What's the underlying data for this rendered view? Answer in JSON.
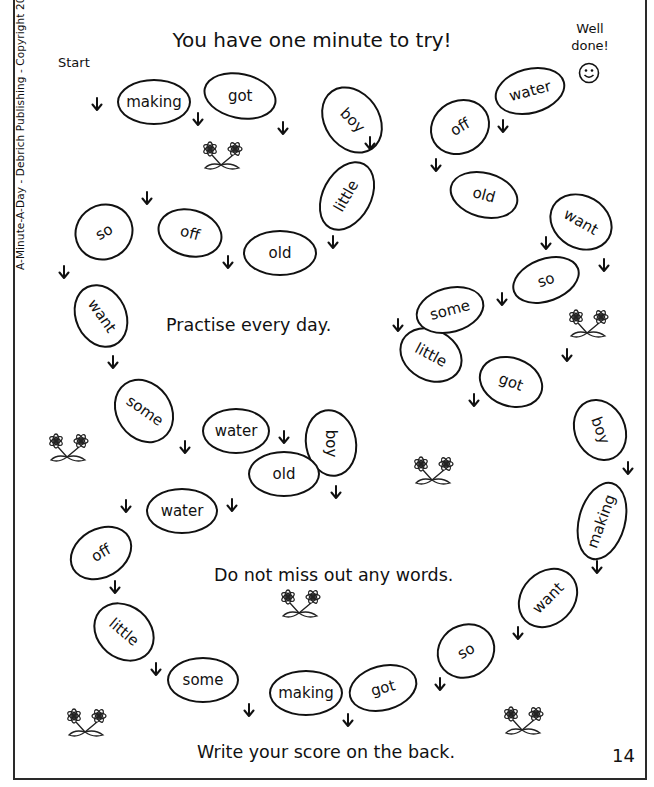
{
  "page": {
    "title": "You have one minute to try!",
    "start_label": "Start",
    "finish_label_line1": "Well",
    "finish_label_line2": "done!",
    "finish_icon": "smiley-face-icon",
    "side_credit": "A-Minute-A-Day - Debrich Publishing - Copyright 2019",
    "messages": [
      "Practise every day.",
      "Do not miss out any words.",
      "Write your score on the back."
    ],
    "page_number": "14"
  },
  "path": {
    "words": [
      {
        "word": "making",
        "x": 154,
        "y": 102,
        "w": 74,
        "h": 46,
        "oval_rot": 0,
        "text_rot": 0
      },
      {
        "word": "got",
        "x": 240,
        "y": 96,
        "w": 74,
        "h": 46,
        "oval_rot": 12,
        "text_rot": 0
      },
      {
        "word": "boy",
        "x": 352,
        "y": 120,
        "w": 56,
        "h": 72,
        "oval_rot": -35,
        "text_rot": 45
      },
      {
        "word": "little",
        "x": 347,
        "y": 196,
        "w": 50,
        "h": 74,
        "oval_rot": 28,
        "text_rot": -60
      },
      {
        "word": "old",
        "x": 280,
        "y": 253,
        "w": 74,
        "h": 46,
        "oval_rot": 0,
        "text_rot": 0
      },
      {
        "word": "off",
        "x": 190,
        "y": 233,
        "w": 66,
        "h": 48,
        "oval_rot": 15,
        "text_rot": 15
      },
      {
        "word": "so",
        "x": 104,
        "y": 232,
        "w": 60,
        "h": 56,
        "oval_rot": -30,
        "text_rot": -30
      },
      {
        "word": "want",
        "x": 101,
        "y": 316,
        "w": 52,
        "h": 66,
        "oval_rot": -25,
        "text_rot": 55
      },
      {
        "word": "some",
        "x": 144,
        "y": 411,
        "w": 56,
        "h": 68,
        "oval_rot": -35,
        "text_rot": 35
      },
      {
        "word": "water",
        "x": 236,
        "y": 431,
        "w": 68,
        "h": 46,
        "oval_rot": 0,
        "text_rot": 0
      },
      {
        "word": "boy",
        "x": 331,
        "y": 443,
        "w": 52,
        "h": 68,
        "oval_rot": -10,
        "text_rot": 90
      },
      {
        "word": "old",
        "x": 284,
        "y": 474,
        "w": 72,
        "h": 46,
        "oval_rot": 0,
        "text_rot": 0
      },
      {
        "word": "water",
        "x": 182,
        "y": 511,
        "w": 72,
        "h": 46,
        "oval_rot": 0,
        "text_rot": 0
      },
      {
        "word": "off",
        "x": 101,
        "y": 553,
        "w": 66,
        "h": 50,
        "oval_rot": -30,
        "text_rot": -30
      },
      {
        "word": "little",
        "x": 124,
        "y": 632,
        "w": 66,
        "h": 54,
        "oval_rot": 40,
        "text_rot": 40
      },
      {
        "word": "some",
        "x": 203,
        "y": 680,
        "w": 72,
        "h": 46,
        "oval_rot": 0,
        "text_rot": 0
      },
      {
        "word": "making",
        "x": 306,
        "y": 693,
        "w": 74,
        "h": 46,
        "oval_rot": 0,
        "text_rot": 0
      },
      {
        "word": "got",
        "x": 383,
        "y": 688,
        "w": 70,
        "h": 46,
        "oval_rot": -15,
        "text_rot": -15
      },
      {
        "word": "so",
        "x": 466,
        "y": 651,
        "w": 60,
        "h": 54,
        "oval_rot": -30,
        "text_rot": -30
      },
      {
        "word": "want",
        "x": 548,
        "y": 598,
        "w": 66,
        "h": 54,
        "oval_rot": -45,
        "text_rot": -45
      },
      {
        "word": "making",
        "x": 602,
        "y": 521,
        "w": 48,
        "h": 80,
        "oval_rot": 15,
        "text_rot": -70
      },
      {
        "word": "boy",
        "x": 600,
        "y": 430,
        "w": 52,
        "h": 64,
        "oval_rot": -25,
        "text_rot": 70
      },
      {
        "word": "got",
        "x": 511,
        "y": 382,
        "w": 66,
        "h": 50,
        "oval_rot": 20,
        "text_rot": 20
      },
      {
        "word": "little",
        "x": 431,
        "y": 355,
        "w": 66,
        "h": 52,
        "oval_rot": 28,
        "text_rot": 28
      },
      {
        "word": "some",
        "x": 450,
        "y": 310,
        "w": 70,
        "h": 46,
        "oval_rot": -15,
        "text_rot": -15
      },
      {
        "word": "so",
        "x": 546,
        "y": 280,
        "w": 70,
        "h": 44,
        "oval_rot": -20,
        "text_rot": -20
      },
      {
        "word": "want",
        "x": 581,
        "y": 222,
        "w": 66,
        "h": 54,
        "oval_rot": 30,
        "text_rot": 30
      },
      {
        "word": "old",
        "x": 484,
        "y": 195,
        "w": 70,
        "h": 46,
        "oval_rot": 15,
        "text_rot": 15
      },
      {
        "word": "off",
        "x": 460,
        "y": 127,
        "w": 62,
        "h": 54,
        "oval_rot": -30,
        "text_rot": -30
      },
      {
        "word": "water",
        "x": 530,
        "y": 91,
        "w": 72,
        "h": 46,
        "oval_rot": -15,
        "text_rot": -15
      }
    ],
    "arrows": [
      {
        "x": 97,
        "y": 104
      },
      {
        "x": 198,
        "y": 119
      },
      {
        "x": 283,
        "y": 128
      },
      {
        "x": 370,
        "y": 143
      },
      {
        "x": 333,
        "y": 242
      },
      {
        "x": 228,
        "y": 262
      },
      {
        "x": 147,
        "y": 198
      },
      {
        "x": 64,
        "y": 272
      },
      {
        "x": 113,
        "y": 362
      },
      {
        "x": 185,
        "y": 447
      },
      {
        "x": 284,
        "y": 437
      },
      {
        "x": 336,
        "y": 492
      },
      {
        "x": 232,
        "y": 505
      },
      {
        "x": 126,
        "y": 506
      },
      {
        "x": 115,
        "y": 587
      },
      {
        "x": 156,
        "y": 669
      },
      {
        "x": 249,
        "y": 710
      },
      {
        "x": 348,
        "y": 720
      },
      {
        "x": 440,
        "y": 684
      },
      {
        "x": 518,
        "y": 633
      },
      {
        "x": 597,
        "y": 567
      },
      {
        "x": 628,
        "y": 468
      },
      {
        "x": 567,
        "y": 355
      },
      {
        "x": 474,
        "y": 400
      },
      {
        "x": 398,
        "y": 325
      },
      {
        "x": 502,
        "y": 299
      },
      {
        "x": 604,
        "y": 265
      },
      {
        "x": 546,
        "y": 243
      },
      {
        "x": 436,
        "y": 165
      },
      {
        "x": 503,
        "y": 126
      }
    ],
    "flowers": [
      {
        "x": 222,
        "y": 155
      },
      {
        "x": 588,
        "y": 323
      },
      {
        "x": 68,
        "y": 447
      },
      {
        "x": 433,
        "y": 470
      },
      {
        "x": 300,
        "y": 603
      },
      {
        "x": 86,
        "y": 722
      },
      {
        "x": 523,
        "y": 720
      }
    ]
  },
  "colors": {
    "ink": "#111111",
    "paper": "#ffffff",
    "border": "#2a2a2a"
  }
}
